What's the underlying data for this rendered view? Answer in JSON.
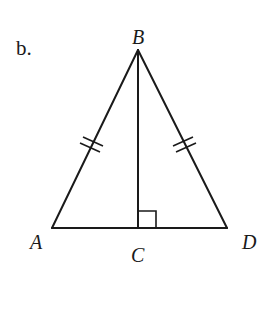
{
  "figure": {
    "part_label": "b.",
    "points": {
      "A": {
        "label": "A",
        "x": 52,
        "y": 228
      },
      "B": {
        "label": "B",
        "x": 138,
        "y": 50
      },
      "C": {
        "label": "C",
        "x": 138,
        "y": 228
      },
      "D": {
        "label": "D",
        "x": 227,
        "y": 228
      }
    },
    "segments": [
      "AB",
      "BD",
      "AD",
      "BC"
    ],
    "congruent_marks": {
      "segments": [
        "AB",
        "BD"
      ],
      "ticks": 2
    },
    "right_angle_at": "C",
    "colors": {
      "stroke": "#1a1a1a",
      "background": "#ffffff"
    }
  }
}
